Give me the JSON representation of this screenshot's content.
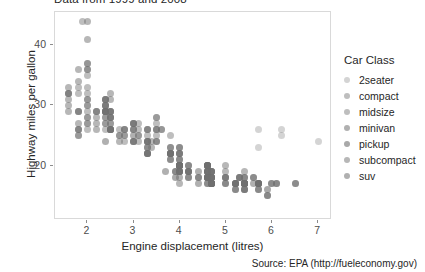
{
  "chart_data": {
    "type": "scatter",
    "title": "Data from 1999 and 2008",
    "xlabel": "Engine displacement (litres)",
    "ylabel": "Highway miles per gallon",
    "caption": "Source: EPA (http://fueleconomy.gov)",
    "xlim": [
      1.3,
      7.3
    ],
    "ylim": [
      11.0,
      45.5
    ],
    "xticks": [
      2,
      3,
      4,
      5,
      6,
      7
    ],
    "yticks": [
      20,
      30,
      40
    ],
    "grid": false,
    "legend_position": "right",
    "legend_title": "Car Class",
    "colors": {
      "point": "#6f6f6f",
      "panel_border": "#d9d9d9",
      "axis_text": "#4d4d4d",
      "title_text": "#262626",
      "background": "#ffffff"
    },
    "series": [
      {
        "name": "2seater",
        "opacity": 0.3,
        "points": [
          [
            5.7,
            26
          ],
          [
            5.7,
            23
          ],
          [
            6.2,
            26
          ],
          [
            6.2,
            25
          ],
          [
            7.0,
            24
          ]
        ]
      },
      {
        "name": "compact",
        "opacity": 0.45,
        "points": [
          [
            1.8,
            29
          ],
          [
            1.8,
            29
          ],
          [
            2.0,
            31
          ],
          [
            2.0,
            30
          ],
          [
            2.8,
            26
          ],
          [
            2.8,
            26
          ],
          [
            3.1,
            27
          ],
          [
            1.8,
            26
          ],
          [
            1.8,
            25
          ],
          [
            2.0,
            28
          ],
          [
            2.0,
            27
          ],
          [
            2.8,
            25
          ],
          [
            2.8,
            25
          ],
          [
            3.1,
            25
          ],
          [
            3.1,
            24
          ],
          [
            2.4,
            27
          ],
          [
            2.4,
            26
          ],
          [
            3.1,
            25
          ],
          [
            3.5,
            26
          ],
          [
            2.4,
            28
          ],
          [
            2.4,
            27
          ],
          [
            2.5,
            27
          ],
          [
            2.5,
            26
          ],
          [
            3.3,
            24
          ],
          [
            2.0,
            33
          ],
          [
            2.0,
            35
          ],
          [
            2.0,
            37
          ],
          [
            2.5,
            29
          ],
          [
            2.5,
            28
          ],
          [
            2.2,
            29
          ],
          [
            2.2,
            29
          ],
          [
            2.4,
            31
          ],
          [
            2.4,
            30
          ],
          [
            1.8,
            26
          ],
          [
            1.8,
            25
          ],
          [
            1.8,
            26
          ],
          [
            2.0,
            28
          ],
          [
            2.0,
            27
          ],
          [
            2.0,
            26
          ],
          [
            2.8,
            24
          ],
          [
            1.9,
            44
          ],
          [
            2.0,
            29
          ]
        ]
      },
      {
        "name": "midsize",
        "opacity": 0.45,
        "points": [
          [
            2.4,
            31
          ],
          [
            2.4,
            30
          ],
          [
            3.1,
            26
          ],
          [
            3.5,
            28
          ],
          [
            2.4,
            29
          ],
          [
            2.4,
            29
          ],
          [
            3.0,
            26
          ],
          [
            3.3,
            26
          ],
          [
            2.4,
            31
          ],
          [
            2.4,
            30
          ],
          [
            3.0,
            27
          ],
          [
            3.3,
            26
          ],
          [
            2.5,
            28
          ],
          [
            2.5,
            27
          ],
          [
            3.5,
            26
          ],
          [
            3.6,
            26
          ],
          [
            2.4,
            31
          ],
          [
            2.4,
            30
          ],
          [
            3.0,
            27
          ],
          [
            3.3,
            26
          ],
          [
            2.4,
            29
          ],
          [
            2.4,
            29
          ],
          [
            3.3,
            25
          ],
          [
            3.5,
            25
          ],
          [
            2.7,
            26
          ],
          [
            2.7,
            25
          ],
          [
            3.0,
            26
          ],
          [
            3.0,
            27
          ],
          [
            3.5,
            28
          ],
          [
            3.8,
            25
          ],
          [
            2.5,
            29
          ],
          [
            2.5,
            28
          ],
          [
            3.5,
            27
          ],
          [
            3.5,
            26
          ],
          [
            1.8,
            33
          ],
          [
            1.8,
            32
          ],
          [
            2.0,
            32
          ],
          [
            2.0,
            30
          ],
          [
            2.4,
            29
          ],
          [
            2.4,
            28
          ],
          [
            3.0,
            26
          ],
          [
            3.0,
            27
          ]
        ]
      },
      {
        "name": "minivan",
        "opacity": 0.55,
        "points": [
          [
            2.4,
            24
          ],
          [
            3.0,
            24
          ],
          [
            3.3,
            22
          ],
          [
            3.3,
            24
          ],
          [
            3.8,
            22
          ],
          [
            3.8,
            21
          ],
          [
            3.8,
            23
          ],
          [
            4.0,
            23
          ],
          [
            3.3,
            23
          ],
          [
            3.3,
            24
          ],
          [
            3.8,
            22
          ],
          [
            3.8,
            22
          ]
        ]
      },
      {
        "name": "pickup",
        "opacity": 0.6,
        "points": [
          [
            4.7,
            19
          ],
          [
            5.7,
            17
          ],
          [
            5.7,
            16
          ],
          [
            6.1,
            17
          ],
          [
            4.0,
            20
          ],
          [
            4.0,
            20
          ],
          [
            4.7,
            17
          ],
          [
            4.7,
            18
          ],
          [
            4.7,
            18
          ],
          [
            5.2,
            17
          ],
          [
            5.2,
            16
          ],
          [
            3.9,
            19
          ],
          [
            3.9,
            18
          ],
          [
            4.7,
            17
          ],
          [
            4.7,
            17
          ],
          [
            4.7,
            18
          ],
          [
            5.2,
            17
          ],
          [
            5.9,
            15
          ],
          [
            4.7,
            19
          ],
          [
            4.7,
            19
          ],
          [
            4.7,
            19
          ],
          [
            5.2,
            17
          ],
          [
            5.7,
            17
          ],
          [
            5.9,
            16
          ],
          [
            4.6,
            19
          ],
          [
            5.4,
            17
          ],
          [
            5.4,
            16
          ],
          [
            4.0,
            20
          ],
          [
            4.2,
            19
          ],
          [
            4.6,
            18
          ],
          [
            4.6,
            19
          ],
          [
            4.6,
            18
          ],
          [
            5.4,
            18
          ],
          [
            5.4,
            17
          ],
          [
            4.0,
            22
          ],
          [
            4.0,
            21
          ],
          [
            4.6,
            20
          ],
          [
            5.0,
            18
          ],
          [
            4.2,
            20
          ],
          [
            4.2,
            19
          ],
          [
            4.4,
            18
          ],
          [
            4.6,
            18
          ],
          [
            5.4,
            17
          ],
          [
            5.4,
            17
          ],
          [
            4.0,
            20
          ],
          [
            4.0,
            19
          ],
          [
            4.6,
            18
          ],
          [
            5.0,
            17
          ]
        ]
      },
      {
        "name": "subcompact",
        "opacity": 0.5,
        "points": [
          [
            1.6,
            33
          ],
          [
            1.6,
            32
          ],
          [
            1.6,
            32
          ],
          [
            1.6,
            29
          ],
          [
            1.6,
            32
          ],
          [
            1.8,
            34
          ],
          [
            1.8,
            36
          ],
          [
            2.0,
            36
          ],
          [
            2.4,
            29
          ],
          [
            2.4,
            29
          ],
          [
            2.5,
            28
          ],
          [
            2.5,
            29
          ],
          [
            3.3,
            24
          ],
          [
            2.0,
            44
          ],
          [
            2.0,
            41
          ],
          [
            2.0,
            36
          ],
          [
            2.0,
            37
          ],
          [
            2.5,
            31
          ],
          [
            2.5,
            32
          ],
          [
            2.5,
            26
          ],
          [
            2.5,
            26
          ],
          [
            2.2,
            29
          ],
          [
            2.2,
            28
          ],
          [
            2.5,
            29
          ],
          [
            2.5,
            26
          ],
          [
            2.5,
            26
          ],
          [
            2.5,
            26
          ],
          [
            2.7,
            25
          ],
          [
            2.7,
            24
          ],
          [
            3.4,
            24
          ],
          [
            3.4,
            23
          ],
          [
            4.0,
            20
          ],
          [
            4.6,
            20
          ],
          [
            5.4,
            19
          ],
          [
            4.0,
            17
          ],
          [
            4.2,
            19
          ],
          [
            5.0,
            20
          ],
          [
            5.0,
            19
          ],
          [
            1.6,
            31
          ],
          [
            1.6,
            30
          ],
          [
            1.8,
            29
          ],
          [
            1.8,
            27
          ],
          [
            2.0,
            31
          ],
          [
            2.8,
            26
          ],
          [
            3.6,
            26
          ],
          [
            2.2,
            26
          ],
          [
            2.2,
            27
          ],
          [
            3.8,
            23
          ]
        ]
      },
      {
        "name": "suv",
        "opacity": 0.55,
        "points": [
          [
            4.0,
            19
          ],
          [
            4.7,
            17
          ],
          [
            4.7,
            17
          ],
          [
            5.2,
            17
          ],
          [
            3.7,
            19
          ],
          [
            4.0,
            19
          ],
          [
            4.7,
            17
          ],
          [
            4.7,
            17
          ],
          [
            5.2,
            16
          ],
          [
            4.0,
            20
          ],
          [
            4.0,
            19
          ],
          [
            4.6,
            18
          ],
          [
            4.6,
            18
          ],
          [
            5.4,
            17
          ],
          [
            5.4,
            17
          ],
          [
            4.0,
            20
          ],
          [
            4.6,
            19
          ],
          [
            4.6,
            19
          ],
          [
            5.4,
            17
          ],
          [
            5.4,
            17
          ],
          [
            3.9,
            19
          ],
          [
            4.7,
            17
          ],
          [
            4.7,
            17
          ],
          [
            4.7,
            18
          ],
          [
            5.2,
            17
          ],
          [
            5.7,
            17
          ],
          [
            5.9,
            15
          ],
          [
            4.6,
            20
          ],
          [
            5.4,
            18
          ],
          [
            4.0,
            19
          ],
          [
            4.0,
            18
          ],
          [
            4.6,
            17
          ],
          [
            5.0,
            17
          ],
          [
            4.2,
            19
          ],
          [
            4.2,
            18
          ],
          [
            4.4,
            17
          ],
          [
            4.6,
            17
          ],
          [
            5.4,
            16
          ],
          [
            5.4,
            16
          ],
          [
            6.5,
            17
          ],
          [
            5.7,
            17
          ],
          [
            5.7,
            17
          ],
          [
            6.0,
            17
          ],
          [
            6.5,
            17
          ],
          [
            4.0,
            22
          ],
          [
            4.0,
            21
          ],
          [
            4.6,
            20
          ],
          [
            5.0,
            18
          ],
          [
            3.0,
            24
          ],
          [
            3.0,
            24
          ],
          [
            3.3,
            22
          ],
          [
            3.3,
            23
          ],
          [
            3.8,
            22
          ],
          [
            3.8,
            21
          ],
          [
            4.0,
            23
          ],
          [
            4.0,
            22
          ],
          [
            4.7,
            18
          ],
          [
            4.7,
            18
          ],
          [
            5.7,
            16
          ],
          [
            6.1,
            17
          ],
          [
            3.0,
            25
          ],
          [
            3.5,
            24
          ],
          [
            3.5,
            24
          ],
          [
            5.6,
            18
          ],
          [
            5.6,
            17
          ],
          [
            4.2,
            18
          ],
          [
            4.4,
            18
          ],
          [
            4.6,
            18
          ],
          [
            5.4,
            17
          ],
          [
            3.3,
            22
          ],
          [
            3.3,
            22
          ],
          [
            4.0,
            20
          ],
          [
            4.2,
            20
          ],
          [
            4.4,
            19
          ],
          [
            4.6,
            19
          ],
          [
            5.0,
            18
          ],
          [
            5.3,
            18
          ],
          [
            5.3,
            18
          ],
          [
            5.3,
            18
          ],
          [
            5.7,
            17
          ],
          [
            6.0,
            17
          ],
          [
            5.6,
            18
          ],
          [
            3.8,
            22
          ],
          [
            3.8,
            22
          ],
          [
            4.0,
            20
          ],
          [
            4.0,
            20
          ],
          [
            4.6,
            20
          ],
          [
            4.6,
            20
          ],
          [
            4.6,
            20
          ],
          [
            5.4,
            17
          ]
        ]
      }
    ]
  },
  "legend": {
    "title": "Car Class",
    "items": [
      {
        "label": "2seater",
        "opacity": 0.3
      },
      {
        "label": "compact",
        "opacity": 0.45
      },
      {
        "label": "midsize",
        "opacity": 0.45
      },
      {
        "label": "minivan",
        "opacity": 0.55
      },
      {
        "label": "pickup",
        "opacity": 0.6
      },
      {
        "label": "subcompact",
        "opacity": 0.5
      },
      {
        "label": "suv",
        "opacity": 0.55
      }
    ]
  }
}
